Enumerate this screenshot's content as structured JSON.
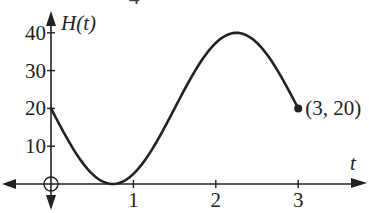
{
  "chart_data": {
    "type": "line",
    "title": "",
    "xlabel": "t",
    "ylabel": "H(t)",
    "x_ticks": [
      1,
      2,
      3
    ],
    "x_tick_labels": [
      "1",
      "2",
      "3"
    ],
    "y_ticks": [
      10,
      20,
      30,
      40
    ],
    "y_tick_labels": [
      "10",
      "20",
      "30",
      "40"
    ],
    "xlim": [
      -0.58,
      3.9
    ],
    "ylim": [
      -4,
      43
    ],
    "grid": false,
    "legend": null,
    "function": "H(t) = 20 - 20*sin(2*pi*t/3)",
    "domain": [
      0,
      3
    ],
    "series": [
      {
        "name": "H(t)",
        "x": [
          0,
          0.25,
          0.5,
          0.75,
          1.0,
          1.25,
          1.5,
          1.75,
          2.0,
          2.25,
          2.5,
          2.75,
          3.0
        ],
        "values": [
          20,
          10,
          2.7,
          0,
          2.7,
          10,
          20,
          30,
          37.3,
          40,
          37.3,
          30,
          20
        ]
      }
    ],
    "key_points": {
      "start": {
        "t": 0,
        "H": 20
      },
      "minimum": {
        "t": 0.75,
        "H": 0
      },
      "maximum": {
        "t": 2.25,
        "H": 40
      },
      "end": {
        "t": 3,
        "H": 20
      }
    },
    "annotations": [
      {
        "text": "(3, 20)",
        "t": 3,
        "H": 20,
        "marker": "filled-dot"
      },
      {
        "text": "",
        "t": 0,
        "H": 0,
        "marker": "open-circle-crosshair"
      }
    ]
  },
  "labels": {
    "y_axis_title": "H(t)",
    "x_axis_title": "t",
    "endpoint_label": "(3, 20)",
    "top_fragment": "4"
  },
  "colors": {
    "ink": "#222222",
    "background": "#ffffff"
  }
}
